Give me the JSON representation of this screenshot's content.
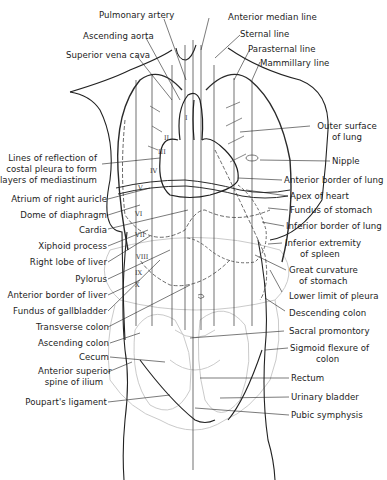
{
  "figure": {
    "type": "anatomical line drawing"
  },
  "labels_top": [
    {
      "id": "pulmonary-artery",
      "text": "Pulmonary artery"
    },
    {
      "id": "anterior-median-line",
      "text": "Anterior median line"
    },
    {
      "id": "ascending-aorta",
      "text": "Ascending aorta"
    },
    {
      "id": "sternal-line",
      "text": "Sternal line"
    },
    {
      "id": "superior-vena-cava",
      "text": "Superior vena cava"
    },
    {
      "id": "parasternal-line",
      "text": "Parasternal line"
    },
    {
      "id": "mammillary-line",
      "text": "Mammillary line"
    }
  ],
  "labels_left": [
    {
      "id": "lines-of-reflection",
      "lines": [
        "Lines of reflection of",
        "costal pleura to form",
        "layers of mediastinum"
      ]
    },
    {
      "id": "atrium-right-auricle",
      "text": "Atrium of right auricle"
    },
    {
      "id": "dome-of-diaphragm",
      "text": "Dome of diaphragm"
    },
    {
      "id": "cardia",
      "text": "Cardia"
    },
    {
      "id": "xiphoid-process",
      "text": "Xiphoid process"
    },
    {
      "id": "right-lobe-liver",
      "text": "Right lobe of liver"
    },
    {
      "id": "pylorus",
      "text": "Pylorus"
    },
    {
      "id": "anterior-border-liver",
      "text": "Anterior border of liver"
    },
    {
      "id": "fundus-gallbladder",
      "text": "Fundus of gallbladder"
    },
    {
      "id": "transverse-colon",
      "text": "Transverse colon"
    },
    {
      "id": "ascending-colon",
      "text": "Ascending colon"
    },
    {
      "id": "cecum",
      "text": "Cecum"
    },
    {
      "id": "anterior-superior-spine",
      "lines": [
        "Anterior superior",
        "spine of ilium"
      ]
    },
    {
      "id": "pouparts-ligament",
      "text": "Poupart's ligament"
    }
  ],
  "labels_right": [
    {
      "id": "outer-surface-lung",
      "lines": [
        "Outer surface",
        "of lung"
      ]
    },
    {
      "id": "nipple",
      "text": "Nipple"
    },
    {
      "id": "anterior-border-lung",
      "text": "Anterior border of lung"
    },
    {
      "id": "apex-of-heart",
      "text": "Apex of heart"
    },
    {
      "id": "fundus-of-stomach",
      "text": "Fundus of stomach"
    },
    {
      "id": "inferior-border-lung",
      "text": "Inferior border of lung"
    },
    {
      "id": "inferior-extremity-spleen",
      "lines": [
        "Inferior extremity",
        "of spleen"
      ]
    },
    {
      "id": "great-curvature",
      "lines": [
        "Great curvature",
        "of stomach"
      ]
    },
    {
      "id": "lower-limit-pleura",
      "text": "Lower limit of pleura"
    },
    {
      "id": "descending-colon",
      "text": "Descending colon"
    },
    {
      "id": "sacral-promontory",
      "text": "Sacral promontory"
    },
    {
      "id": "sigmoid-flexure",
      "lines": [
        "Sigmoid flexure of",
        "colon"
      ]
    },
    {
      "id": "rectum",
      "text": "Rectum"
    },
    {
      "id": "urinary-bladder",
      "text": "Urinary bladder"
    },
    {
      "id": "pubic-symphysis",
      "text": "Pubic symphysis"
    }
  ],
  "rib_numerals": [
    "I",
    "II",
    "III",
    "IV",
    "V",
    "VI",
    "VII",
    "VIII",
    "IX",
    "X"
  ],
  "colors": {
    "ink": "#1c1c1c",
    "faint_ink": "#b8b8b8",
    "background": "#ffffff"
  }
}
